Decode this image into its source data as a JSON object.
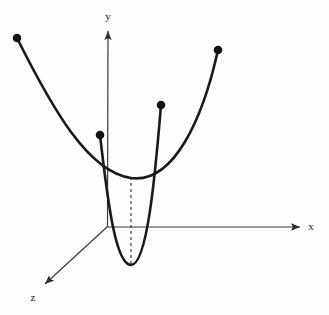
{
  "figure": {
    "background_color": "#fdfdfd",
    "width": 329,
    "height": 315
  },
  "axes": {
    "origin": {
      "x": 107,
      "y": 227
    },
    "color": "#3a3a3a",
    "stroke_width": 1.2,
    "items": [
      {
        "name": "x-axis",
        "label": "x",
        "label_x": 313,
        "label_y": 229,
        "from": {
          "x": 107,
          "y": 227
        },
        "to": {
          "x": 302,
          "y": 227
        },
        "arrow": true
      },
      {
        "name": "y-axis",
        "label": "y",
        "label_x": 108,
        "label_y": 20,
        "from": {
          "x": 107,
          "y": 227
        },
        "to": {
          "x": 108,
          "y": 28
        },
        "arrow": true
      },
      {
        "name": "z-axis",
        "label": "z",
        "label_x": 33,
        "label_y": 300,
        "from": {
          "x": 107,
          "y": 227
        },
        "to": {
          "x": 42,
          "y": 287
        },
        "arrow": true
      }
    ]
  },
  "curves": [
    {
      "name": "wide-parabola-xy",
      "description": "Broad parabola opening upward in the xy-plane",
      "color": "#1a1a1a",
      "stroke_width": 2.6,
      "vertex": {
        "x": 131,
        "y": 178
      },
      "start": {
        "x": 17,
        "y": 38
      },
      "end": {
        "x": 218,
        "y": 50
      },
      "endpoint_dots": [
        {
          "x": 17,
          "y": 38
        },
        {
          "x": 218,
          "y": 50
        }
      ]
    },
    {
      "name": "narrow-parabola-zy",
      "description": "Narrow parabola opening upward along the z-direction",
      "color": "#1a1a1a",
      "stroke_width": 2.6,
      "vertex": {
        "x": 131,
        "y": 265
      },
      "start": {
        "x": 100,
        "y": 135
      },
      "end": {
        "x": 161,
        "y": 105
      },
      "endpoint_dots": [
        {
          "x": 100,
          "y": 135
        },
        {
          "x": 161,
          "y": 105
        }
      ]
    }
  ],
  "dashed_line": {
    "name": "vertex-connector",
    "description": "Dashed segment joining the two parabola vertices",
    "from": {
      "x": 131,
      "y": 178
    },
    "to": {
      "x": 131,
      "y": 265
    },
    "color": "#2b2b2b",
    "dash_pattern": "3,3",
    "stroke_width": 1.1
  },
  "dots": {
    "color": "#111111",
    "radius": 4.2
  }
}
